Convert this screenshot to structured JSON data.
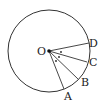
{
  "diagram": {
    "type": "circle-geometry",
    "center": {
      "label": "O",
      "x": 49,
      "y": 51
    },
    "radius": 41,
    "points": [
      {
        "label": "D",
        "x": 89,
        "y": 43,
        "lx": 92,
        "ly": 47
      },
      {
        "label": "C",
        "x": 87,
        "y": 62,
        "lx": 90,
        "ly": 66
      },
      {
        "label": "B",
        "x": 78,
        "y": 79,
        "lx": 82,
        "ly": 86
      },
      {
        "label": "A",
        "x": 64,
        "y": 89,
        "lx": 65,
        "ly": 100
      }
    ],
    "angle_marks": 3,
    "colors": {
      "stroke": "#333333",
      "text": "#222222",
      "background": "#ffffff"
    }
  }
}
